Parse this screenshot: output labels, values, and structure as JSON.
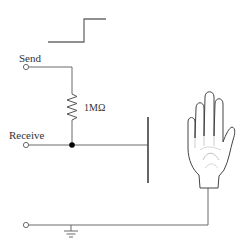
{
  "diagram": {
    "type": "capacitive touch sensor circuit",
    "labels": {
      "send": "Send",
      "receive": "Receive",
      "resistor": "1MΩ"
    },
    "components": {
      "waveform": "step-pulse",
      "resistor": "1MΩ resistor between Send and Receive",
      "plate": "sensor plate",
      "hand": "human hand",
      "ground": "ground symbol"
    },
    "colors": {
      "line": "#6b6b6b",
      "text": "#333333",
      "node": "#000000",
      "background": "#ffffff"
    }
  }
}
